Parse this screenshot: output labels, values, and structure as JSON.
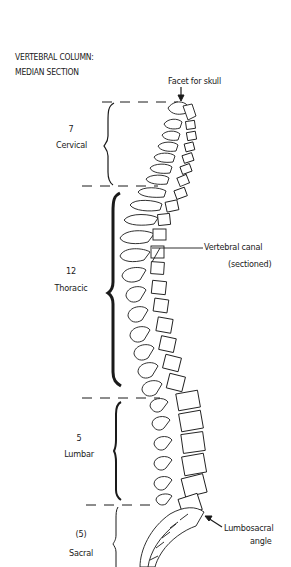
{
  "title": {
    "line1": "VERTEBRAL COLUMN:",
    "line2": "MEDIAN SECTION"
  },
  "regions": [
    {
      "name": "cervical",
      "count": "7",
      "label": "Cervical"
    },
    {
      "name": "thoracic",
      "count": "12",
      "label": "Thoracic"
    },
    {
      "name": "lumbar",
      "count": "5",
      "label": "Lumbar"
    },
    {
      "name": "sacral",
      "count": "(5)",
      "label": "Sacral"
    }
  ],
  "annotations": {
    "facet": "Facet for skull",
    "canal_line1": "Vertebral canal",
    "canal_line2": "(sectioned)",
    "lumbosacral_line1": "Lumbosacral",
    "lumbosacral_line2": "angle"
  },
  "colors": {
    "ink": "#1a1a1a",
    "background": "#ffffff"
  }
}
